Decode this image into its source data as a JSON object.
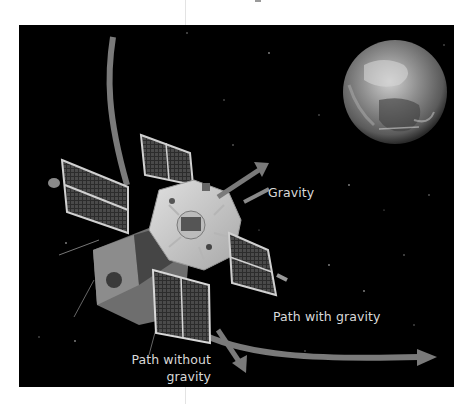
{
  "diagram": {
    "labels": {
      "gravity": "Gravity",
      "path_with_gravity": "Path with gravity",
      "path_without_gravity": "Path without gravity"
    },
    "elements": {
      "earth": "Earth",
      "satellite": "Satellite",
      "gravity_arrow": "gravity-arrow",
      "curved_orbit_path": "path-with-gravity-arrow",
      "straight_path": "path-without-gravity-arrow"
    },
    "colors": {
      "background": "#000000",
      "arrow": "#7a7a7a",
      "text": "#d9d9d9"
    }
  }
}
